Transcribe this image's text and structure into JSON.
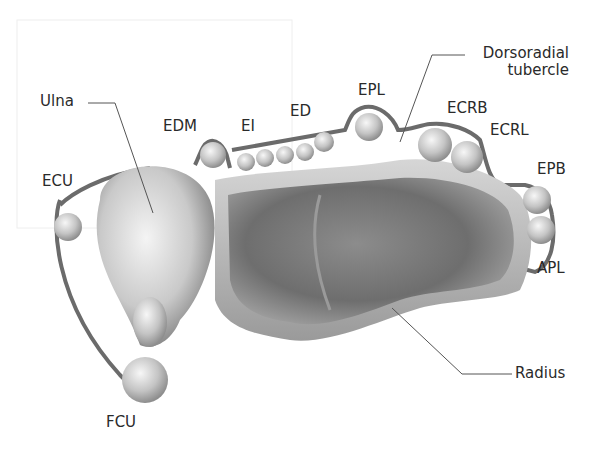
{
  "diagram": {
    "labels": {
      "ulna": "Ulna",
      "ecu": "ECU",
      "edm": "EDM",
      "ei": "EI",
      "ed": "ED",
      "epl": "EPL",
      "dorsoradial_line1": "Dorsoradial",
      "dorsoradial_line2": "tubercle",
      "ecrb": "ECRB",
      "ecrl": "ECRL",
      "epb": "EPB",
      "apl": "APL",
      "radius": "Radius",
      "fcu": "FCU"
    },
    "colors": {
      "line": "#6b6b6b",
      "leader": "#555555",
      "bone_dark": "#5c5c5c",
      "bone_light": "#d9d9d9",
      "tendon": "#c8c8c8",
      "background": "#ffffff"
    }
  }
}
